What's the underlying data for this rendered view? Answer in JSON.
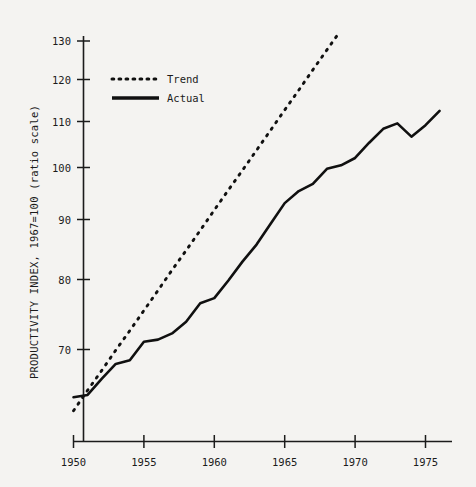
{
  "chart_data": {
    "type": "line",
    "title": "",
    "subtitle": "",
    "xlabel": "",
    "ylabel": "PRODUCTIVITY INDEX, 1967=100 (ratio scale)",
    "yscale": "log",
    "xscale": "linear",
    "xlim": [
      1949.6,
      1976.9
    ],
    "ylim": [
      61.0,
      133.0
    ],
    "grid": false,
    "legend_position": "upper-left-inside",
    "xticks": [
      1950,
      1955,
      1960,
      1965,
      1970,
      1975
    ],
    "xticklabels": [
      "1950",
      "1955",
      "1960",
      "1965",
      "1970",
      "1975"
    ],
    "yticks": [
      70,
      80,
      90,
      100,
      110,
      120,
      130
    ],
    "yticklabels": [
      "70",
      "80",
      "90",
      "100",
      "110",
      "120",
      "130"
    ],
    "x": [
      1950,
      1951,
      1952,
      1953,
      1954,
      1955,
      1956,
      1957,
      1958,
      1959,
      1960,
      1961,
      1962,
      1963,
      1964,
      1965,
      1966,
      1967,
      1968,
      1969,
      1970,
      1971,
      1972,
      1973,
      1974,
      1975,
      1976,
      1977
    ],
    "series": [
      {
        "name": "Trend",
        "style": "dotted",
        "color": "#101010",
        "values": [
          61.9,
          64.5,
          67.1,
          69.9,
          72.7,
          75.7,
          78.8,
          82.1,
          85.4,
          88.9,
          92.6,
          96.4,
          100.3,
          104.4,
          108.7,
          113.2,
          117.8,
          122.7,
          127.7,
          132.9,
          138.4,
          144.1,
          150.0,
          156.2,
          162.6,
          169.3,
          176.2,
          183.5
        ]
      },
      {
        "name": "Actual",
        "style": "solid",
        "color": "#101010",
        "values": [
          63.6,
          63.9,
          66.0,
          68.0,
          68.5,
          71.1,
          71.4,
          72.3,
          74.0,
          76.8,
          77.6,
          80.4,
          83.5,
          86.4,
          90.1,
          93.9,
          96.2,
          97.6,
          100.6,
          101.3,
          102.8,
          106.0,
          109.0,
          110.2,
          107.3,
          109.8,
          113.0,
          115.0
        ]
      }
    ],
    "legend": [
      {
        "label": "Trend",
        "style": "dotted"
      },
      {
        "label": "Actual",
        "style": "solid"
      }
    ]
  },
  "axes": {
    "y_axis_title": "PRODUCTIVITY INDEX, 1967=100 (ratio scale)"
  }
}
